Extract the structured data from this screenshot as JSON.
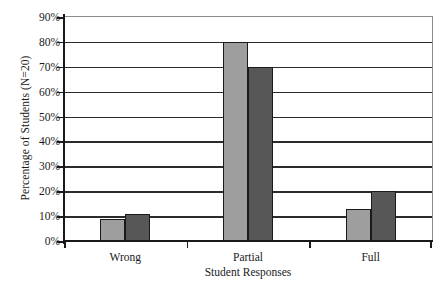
{
  "chart_data": {
    "type": "bar",
    "title": "",
    "subtitle": "",
    "xlabel": "Student Responses",
    "ylabel": "Percentage of Students (N=20)",
    "categories": [
      "Wrong",
      "Partial",
      "Full"
    ],
    "series": [
      {
        "name": "light-gray-series",
        "color": "#9e9e9e",
        "values": [
          9,
          80,
          13
        ]
      },
      {
        "name": "dark-gray-series",
        "color": "#575757",
        "values": [
          11,
          70,
          20
        ]
      }
    ],
    "ylim": [
      0,
      90
    ],
    "ytick_values": [
      0,
      10,
      20,
      30,
      40,
      50,
      60,
      70,
      80,
      90
    ],
    "ytick_labels": [
      "0%",
      "10%",
      "20%",
      "30%",
      "40%",
      "50%",
      "60%",
      "70%",
      "80%",
      "90%"
    ],
    "grid": "horizontal",
    "legend": "none",
    "annotations": [],
    "axis_color": "#1a1a1a",
    "grid_color": "#2b2b2b",
    "plot_border_color": "#8c8c8c",
    "background_color": "#ffffff"
  }
}
